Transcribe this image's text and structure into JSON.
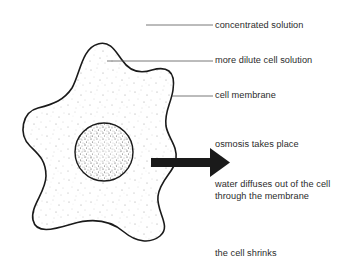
{
  "diagram": {
    "type": "labelled-illustration",
    "labels": {
      "concentrated_solution": "concentrated solution",
      "dilute_cell_solution": "more dilute cell solution",
      "cell_membrane": "cell membrane",
      "osmosis": "osmosis takes place",
      "water_diffuses_line1": "water diffuses out of the cell",
      "water_diffuses_line2": "through the membrane",
      "cell_shrinks": "the cell shrinks"
    },
    "arrow": {
      "direction": "right",
      "meaning": "water moving out of the cell"
    },
    "colors": {
      "outline": "#1a1a1a",
      "text": "#2b2b2b",
      "leader_line": "#555555",
      "stipple": "#8a8a8a",
      "nucleus_stipple": "#333333",
      "background": "#ffffff"
    }
  }
}
